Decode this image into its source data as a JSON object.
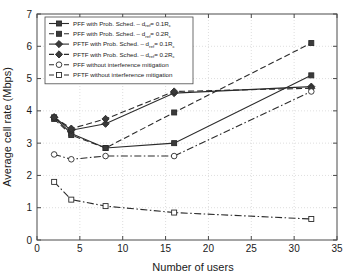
{
  "chart_data": {
    "type": "line",
    "title": "",
    "xlabel": "Number of users",
    "ylabel": "Average cell rate (Mbps)",
    "xlim": [
      0,
      35
    ],
    "ylim": [
      0,
      7
    ],
    "xticks": [
      0,
      5,
      10,
      15,
      20,
      25,
      30,
      35
    ],
    "yticks": [
      0,
      1,
      2,
      3,
      4,
      5,
      6,
      7
    ],
    "grid": true,
    "legend_position": "upper left",
    "x": [
      2,
      4,
      8,
      16,
      32
    ],
    "series": [
      {
        "name": "PFF with Prob. Sched. – d_ref = 0.1R_c",
        "label_main": "PFF with Prob. Sched.  –  d",
        "label_sub1": "ref",
        "label_mid": "= 0.1R",
        "label_sub2": "c",
        "linestyle": "solid",
        "marker": "filled-square",
        "values": [
          3.8,
          3.3,
          2.85,
          3.0,
          5.1
        ]
      },
      {
        "name": "PFF with Prob. Sched. – d_ref = 0.2R_c",
        "label_main": "PFF with Prob. Sched.  –  d",
        "label_sub1": "ref",
        "label_mid": "= 0.2R",
        "label_sub2": "c",
        "linestyle": "dashed",
        "marker": "filled-square",
        "values": [
          3.75,
          3.25,
          2.85,
          3.95,
          6.1
        ]
      },
      {
        "name": "PFTF with Prob. Sched. – d_ref = 0.1R_c",
        "label_main": "PFTF with Prob. Sched.  –  d",
        "label_sub1": "ref",
        "label_mid": "= 0.1R",
        "label_sub2": "c",
        "linestyle": "solid",
        "marker": "filled-diamond",
        "values": [
          3.8,
          3.4,
          3.6,
          4.55,
          4.75
        ]
      },
      {
        "name": "PFTF with Prob. Sched. – d_ref = 0.2R_c",
        "label_main": "PFTF with Prob. Sched.  –  d",
        "label_sub1": "ref",
        "label_mid": "= 0.2R",
        "label_sub2": "c",
        "linestyle": "dashed",
        "marker": "filled-diamond",
        "values": [
          3.8,
          3.45,
          3.75,
          4.6,
          4.7
        ]
      },
      {
        "name": "PFF without interference mitigation",
        "label_main": "PFF without interference mitigation",
        "label_sub1": "",
        "label_mid": "",
        "label_sub2": "",
        "linestyle": "dashdot",
        "marker": "open-circle",
        "values": [
          2.65,
          2.5,
          2.6,
          2.6,
          4.6
        ]
      },
      {
        "name": "PFTF without interference mitigation",
        "label_main": "PFTF without interference mitigation",
        "label_sub1": "",
        "label_mid": "",
        "label_sub2": "",
        "linestyle": "dashdot",
        "marker": "open-square",
        "values": [
          1.8,
          1.25,
          1.05,
          0.85,
          0.65
        ]
      }
    ],
    "colors": {
      "line": "#2b2b2b",
      "axis": "#4a4a4a",
      "grid": "#c8c8c8",
      "background": "#ffffff"
    }
  }
}
